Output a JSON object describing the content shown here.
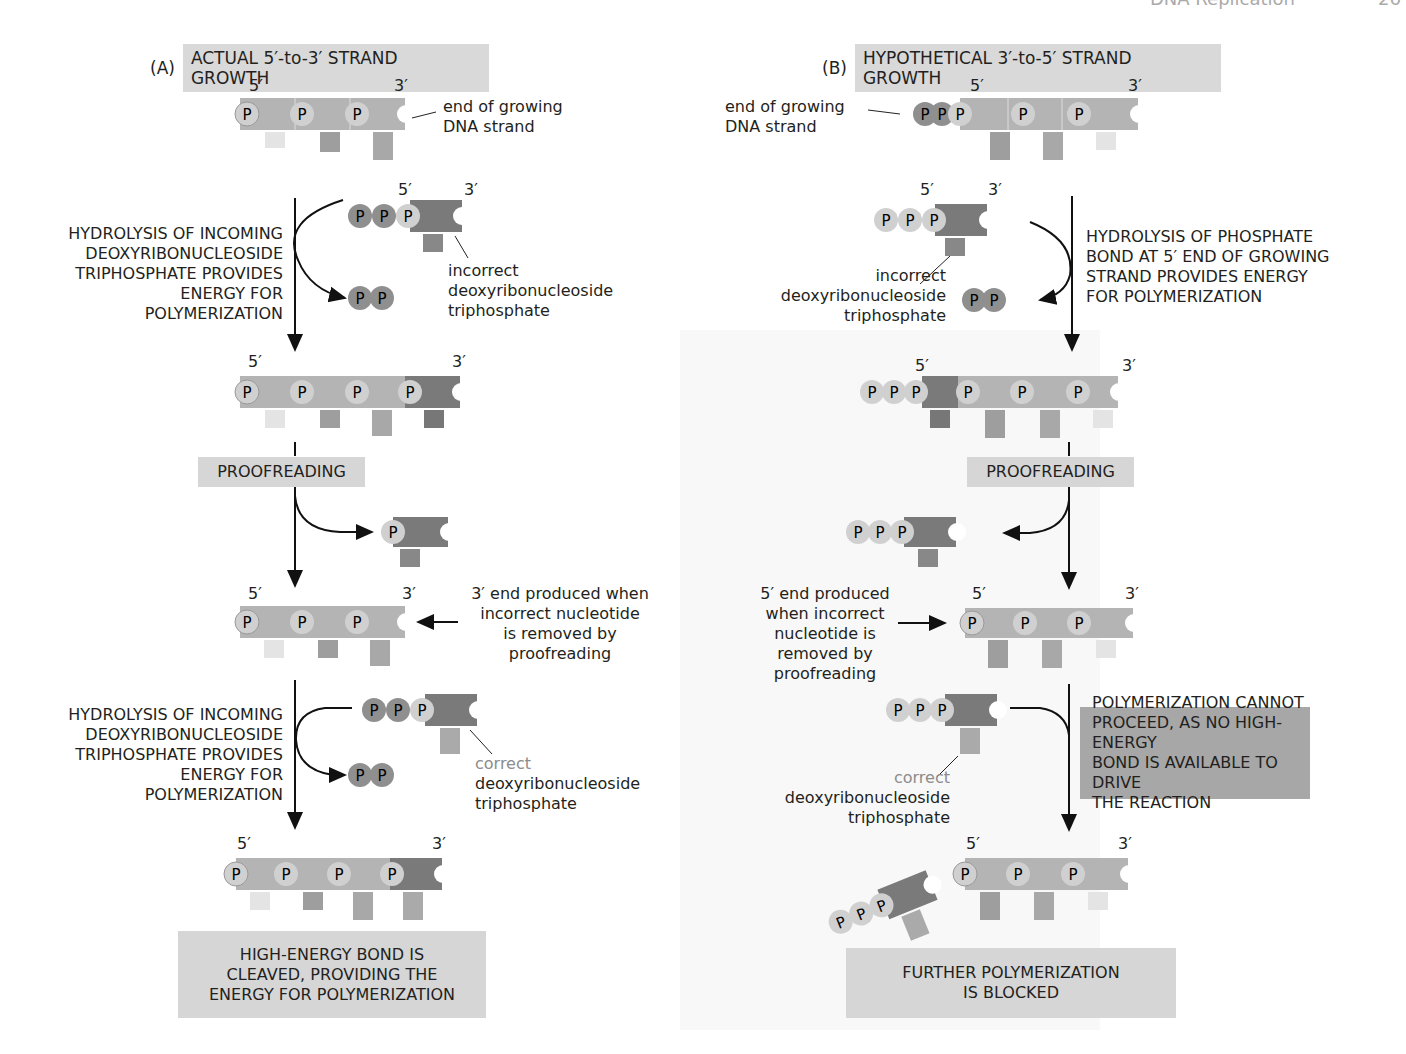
{
  "page_header": {
    "running_title": "DNA Replication",
    "page_number": "26"
  },
  "panel_a": {
    "letter": "(A)",
    "title": "ACTUAL 5′-to-3′ STRAND GROWTH",
    "end_label_1": "end of growing",
    "end_label_2": "DNA strand",
    "step1_caption": [
      "HYDROLYSIS OF INCOMING",
      "DEOXYRIBONUCLEOSIDE",
      "TRIPHOSPHATE PROVIDES",
      "ENERGY FOR",
      "POLYMERIZATION"
    ],
    "incorrect_label": [
      "incorrect",
      "deoxyribonucleoside",
      "triphosphate"
    ],
    "proofreading": "PROOFREADING",
    "three_prime_end_label": [
      "3′ end produced when",
      "incorrect nucleotide",
      "is removed by",
      "proofreading"
    ],
    "step3_caption": [
      "HYDROLYSIS OF INCOMING",
      "DEOXYRIBONUCLEOSIDE",
      "TRIPHOSPHATE PROVIDES",
      "ENERGY FOR",
      "POLYMERIZATION"
    ],
    "correct_label": [
      "correct",
      "deoxyribonucleoside",
      "triphosphate"
    ],
    "result_box": [
      "HIGH-ENERGY BOND IS",
      "CLEAVED, PROVIDING THE",
      "ENERGY FOR POLYMERIZATION"
    ]
  },
  "panel_b": {
    "letter": "(B)",
    "title": "HYPOTHETICAL 3′-to-5′ STRAND GROWTH",
    "end_label_1": "end of growing",
    "end_label_2": "DNA strand",
    "step1_caption": [
      "HYDROLYSIS OF PHOSPHATE",
      "BOND AT 5′ END OF GROWING",
      "STRAND PROVIDES ENERGY",
      "FOR POLYMERIZATION"
    ],
    "incorrect_label": [
      "incorrect",
      "deoxyribonucleoside",
      "triphosphate"
    ],
    "proofreading": "PROOFREADING",
    "five_prime_end_label": [
      "5′ end produced",
      "when incorrect",
      "nucleotide is",
      "removed by",
      "proofreading"
    ],
    "blocked_box": [
      "POLYMERIZATION CANNOT",
      "PROCEED, AS NO HIGH-ENERGY",
      "BOND IS AVAILABLE TO DRIVE",
      "THE REACTION"
    ],
    "correct_label": [
      "correct",
      "deoxyribonucleoside",
      "triphosphate"
    ],
    "result_box": [
      "FURTHER POLYMERIZATION",
      "IS BLOCKED"
    ]
  },
  "labels": {
    "five_prime": "5′",
    "three_prime": "3′",
    "phosphate": "P"
  },
  "colors": {
    "strand_light": "#b4b4b4",
    "strand_dark": "#7a7a7a",
    "phosphate_light": "#d0d0d0",
    "phosphate_dark": "#8f8f8f",
    "base_pale": "#e4e4e4",
    "base_mid": "#9e9e9e",
    "label_box": "#d6d6d6",
    "label_box_dark": "#a7a7a7"
  }
}
